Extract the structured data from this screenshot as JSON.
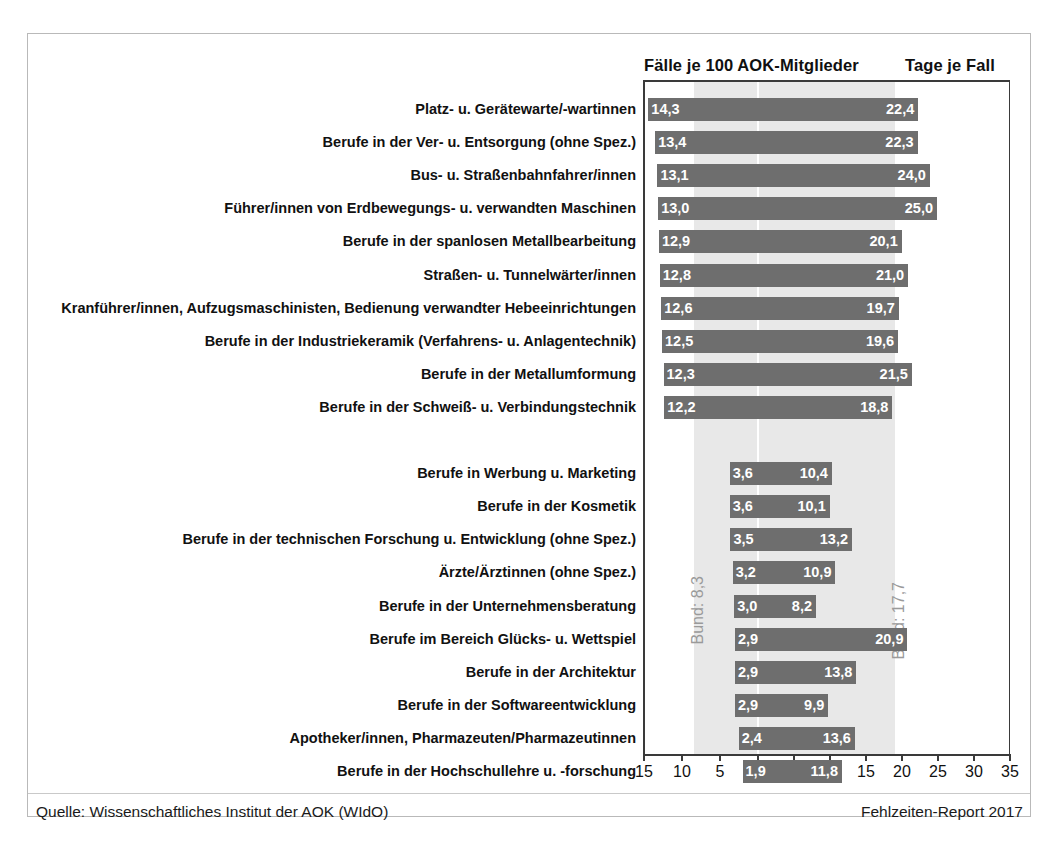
{
  "header": {
    "left_title": "Fälle je 100 AOK-Mitglieder",
    "right_title": "Tage je Fall"
  },
  "annotations": {
    "bund_left": "Bund: 8,3",
    "bund_right": "Bund: 17,7"
  },
  "footer": {
    "source": "Quelle: Wissenschaftliches Institut der AOK (WIdO)",
    "report": "Fehlzeiten-Report 2017"
  },
  "axis": {
    "tick_labels": [
      "15",
      "10",
      "5",
      "0",
      "5",
      "10",
      "15",
      "20",
      "25",
      "30",
      "35"
    ],
    "tick_values": [
      -15,
      -10,
      -5,
      0,
      5,
      10,
      15,
      20,
      25,
      30,
      35
    ]
  },
  "colors": {
    "bar": "#6e6e6e",
    "band": "#e8e8e8",
    "axis": "#3a3a3a",
    "bar_value_text": "#ffffff",
    "bund_text": "#9a9a9a"
  },
  "chart_data": {
    "type": "bar",
    "orientation": "horizontal",
    "layout": "bidirectional-pyramid",
    "title": "",
    "subtitle": "",
    "xlabel": "",
    "ylabel": "",
    "grid": false,
    "legend_position": "top",
    "left_axis_label": "Fälle je 100 AOK-Mitglieder",
    "right_axis_label": "Tage je Fall",
    "left_axis_range": [
      15,
      0
    ],
    "right_axis_range": [
      0,
      35
    ],
    "reference_lines": {
      "left_bund": 8.3,
      "right_bund": 17.7
    },
    "categories": [
      "Platz- u. Gerätewarte/-wartinnen",
      "Berufe in der Ver- u. Entsorgung (ohne Spez.)",
      "Bus- u. Straßenbahnfahrer/innen",
      "Führer/innen von Erdbewegungs- u. verwandten Maschinen",
      "Berufe in der spanlosen Metallbearbeitung",
      "Straßen- u. Tunnelwärter/innen",
      "Kranführer/innen, Aufzugsmaschinisten, Bedienung verwandter Hebeeinrichtungen",
      "Berufe in der Industriekeramik (Verfahrens- u. Anlagentechnik)",
      "Berufe in der Metallumformung",
      "Berufe in der Schweiß- u. Verbindungstechnik",
      "",
      "Berufe in Werbung u. Marketing",
      "Berufe in der Kosmetik",
      "Berufe in der technischen Forschung u. Entwicklung (ohne Spez.)",
      "Ärzte/Ärztinnen (ohne Spez.)",
      "Berufe in der Unternehmensberatung",
      "Berufe im Bereich Glücks- u. Wettspiel",
      "Berufe in der Architektur",
      "Berufe in der Softwareentwicklung",
      "Apotheker/innen, Pharmazeuten/Pharmazeutinnen",
      "Berufe in der Hochschullehre u. -forschung"
    ],
    "series": [
      {
        "name": "Fälle je 100 AOK-Mitglieder",
        "side": "left",
        "values": [
          14.3,
          13.4,
          13.1,
          13.0,
          12.9,
          12.8,
          12.6,
          12.5,
          12.3,
          12.2,
          null,
          3.6,
          3.6,
          3.5,
          3.2,
          3.0,
          2.9,
          2.9,
          2.9,
          2.4,
          1.9
        ],
        "labels": [
          "14,3",
          "13,4",
          "13,1",
          "13,0",
          "12,9",
          "12,8",
          "12,6",
          "12,5",
          "12,3",
          "12,2",
          "",
          "3,6",
          "3,6",
          "3,5",
          "3,2",
          "3,0",
          "2,9",
          "2,9",
          "2,9",
          "2,4",
          "1,9"
        ]
      },
      {
        "name": "Tage je Fall",
        "side": "right",
        "values": [
          22.4,
          22.3,
          24.0,
          25.0,
          20.1,
          21.0,
          19.7,
          19.6,
          21.5,
          18.8,
          null,
          10.4,
          10.1,
          13.2,
          10.9,
          8.2,
          20.9,
          13.8,
          9.9,
          13.6,
          11.8
        ],
        "labels": [
          "22,4",
          "22,3",
          "24,0",
          "25,0",
          "20,1",
          "21,0",
          "19,7",
          "19,6",
          "21,5",
          "18,8",
          "",
          "10,4",
          "10,1",
          "13,2",
          "10,9",
          "8,2",
          "20,9",
          "13,8",
          "9,9",
          "13,6",
          "11,8"
        ]
      }
    ]
  }
}
